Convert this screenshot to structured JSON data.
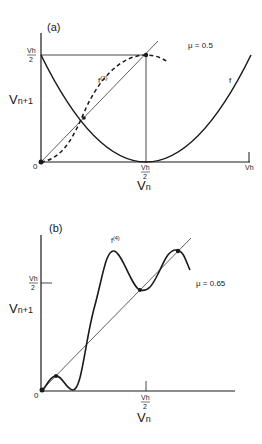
{
  "panel_a": {
    "label": "(a)",
    "mu_label": "μ = 0.5",
    "curve_f_label": "f",
    "curve_f2_label": "f(2)",
    "y_axis_label": "Vn+1",
    "x_axis_label": "Vn",
    "origin_label": "0",
    "x_tick_half_num": "Vh",
    "x_tick_half_den": "2",
    "x_tick_end": "Vh",
    "y_tick_half_num": "Vh",
    "y_tick_half_den": "2"
  },
  "panel_b": {
    "label": "(b)",
    "mu_label": "μ = 0.65",
    "curve_f4_label": "f(4)",
    "y_axis_label": "Vn+1",
    "x_axis_label": "Vn",
    "origin_label": "0",
    "x_tick_half_num": "Vh",
    "x_tick_half_den": "2",
    "y_tick_half_num": "Vh",
    "y_tick_half_den": "2"
  },
  "colors": {
    "ink": "#1a1a1a",
    "background": "#ffffff"
  }
}
